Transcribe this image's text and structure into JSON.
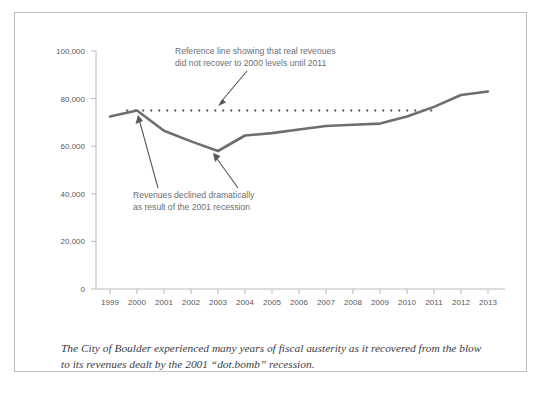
{
  "chart_data": {
    "type": "line",
    "title": "",
    "xlabel": "",
    "ylabel": "",
    "categories": [
      "1999",
      "2000",
      "2001",
      "2002",
      "2003",
      "2004",
      "2005",
      "2006",
      "2007",
      "2008",
      "2009",
      "2010",
      "2011",
      "2012",
      "2013"
    ],
    "series": [
      {
        "name": "Real revenues",
        "values": [
          72500,
          75000,
          66500,
          62000,
          58000,
          64500,
          65500,
          67000,
          68500,
          69000,
          69500,
          72500,
          76500,
          81500,
          83000
        ]
      }
    ],
    "reference_line": {
      "name": "2000 level reference line",
      "value": 75000,
      "style": "dotted",
      "x_start": "1999.6",
      "x_end": "2011"
    },
    "ylim": [
      0,
      100000
    ],
    "yticks": [
      "0",
      "20,000",
      "40,000",
      "60,000",
      "80,000",
      "100,000"
    ],
    "ytick_values": [
      0,
      20000,
      40000,
      60000,
      80000,
      100000
    ],
    "xticks": [
      "1999",
      "2000",
      "2001",
      "2002",
      "2003",
      "2004",
      "2005",
      "2006",
      "2007",
      "2008",
      "2009",
      "2010",
      "2011",
      "2012",
      "2013"
    ],
    "grid": false,
    "legend": "none",
    "line_color": "#6d6e71",
    "axis_color": "#b9b9bb",
    "annotations": [
      {
        "id": "reference-line-annotation",
        "lines": [
          "Reference line showing that real revenues",
          "did not recover to 2000 levels until 2011"
        ]
      },
      {
        "id": "recession-annotation",
        "lines": [
          "Revenues declined dramatically",
          "as result of the 2001 recession"
        ]
      }
    ]
  },
  "caption": {
    "line1": "The City of Boulder experienced many years of fiscal austerity as it recovered from the blow",
    "line2": "to its revenues dealt by the 2001 “dot.bomb” recession."
  },
  "colors": {
    "line": "#6d6e71",
    "axis": "#b9b9bb",
    "text": "#58585a",
    "annotation": "#6d6e71",
    "border": "#bfbfbf",
    "caption": "#3d3d3f"
  }
}
